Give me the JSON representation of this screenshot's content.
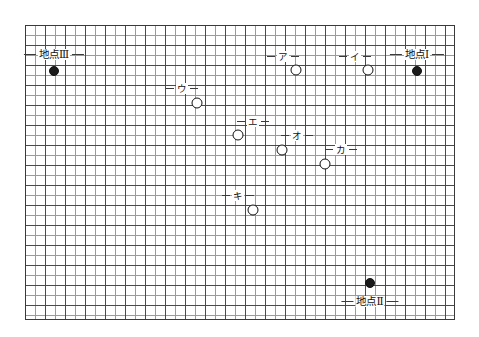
{
  "figure": {
    "title": "",
    "type": "grid-map-with-plotted-points",
    "grid": {
      "left": 25,
      "top": 25,
      "width": 430,
      "height": 295,
      "minor_cell_px": 10,
      "major_cell_px": 20,
      "minor_color": "#9a9a9a",
      "major_color": "#4a4a4a",
      "border_color": "#3a3a3a",
      "background": "#ffffff"
    },
    "marker_colors": {
      "open_fill": "#ffffff",
      "open_stroke": "#111111",
      "filled": "#1a1a1a"
    }
  },
  "sites": [
    {
      "id": "site-1",
      "label": "地点Ⅰ",
      "marker": "filled",
      "x": 417,
      "y": 71,
      "label_x": 417,
      "label_y": 54,
      "leader_left": true,
      "leader_right": true
    },
    {
      "id": "site-2",
      "label": "地点Ⅱ",
      "marker": "filled",
      "x": 370,
      "y": 283,
      "label_x": 370,
      "label_y": 301,
      "leader_left": true,
      "leader_right": true
    },
    {
      "id": "site-3",
      "label": "地点Ⅲ",
      "marker": "filled",
      "x": 54,
      "y": 71,
      "label_x": 54,
      "label_y": 54,
      "leader_left": true,
      "leader_right": true
    }
  ],
  "points": [
    {
      "id": "point-a",
      "label": "ア",
      "marker": "open",
      "x": 296,
      "y": 70,
      "label_x": 283,
      "label_y": 56,
      "leader_left": true,
      "leader_right": true
    },
    {
      "id": "point-i",
      "label": "イ",
      "marker": "open",
      "x": 368,
      "y": 70,
      "label_x": 355,
      "label_y": 56,
      "leader_left": true,
      "leader_right": true
    },
    {
      "id": "point-u",
      "label": "ウ",
      "marker": "open",
      "x": 197,
      "y": 103,
      "label_x": 182,
      "label_y": 88,
      "leader_left": true,
      "leader_right": true
    },
    {
      "id": "point-e",
      "label": "エ",
      "marker": "open",
      "x": 238,
      "y": 135,
      "label_x": 253,
      "label_y": 121,
      "leader_left": true,
      "leader_right": true
    },
    {
      "id": "point-o",
      "label": "オ",
      "marker": "open",
      "x": 282,
      "y": 150,
      "label_x": 297,
      "label_y": 135,
      "leader_left": true,
      "leader_right": true
    },
    {
      "id": "point-ka",
      "label": "カ",
      "marker": "open",
      "x": 325,
      "y": 164,
      "label_x": 341,
      "label_y": 149,
      "leader_left": true,
      "leader_right": true
    },
    {
      "id": "point-ki",
      "label": "キ",
      "marker": "open",
      "x": 253,
      "y": 210,
      "label_x": 238,
      "label_y": 195,
      "leader_left": true,
      "leader_right": true
    }
  ]
}
